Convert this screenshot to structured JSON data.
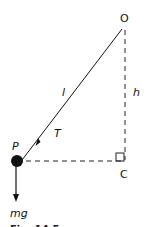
{
  "diagram": {
    "points": {
      "O": {
        "label": "O",
        "x": 125,
        "y": 17
      },
      "P": {
        "label": "P",
        "x": 21,
        "y": 161
      },
      "C": {
        "label": "C",
        "x": 125,
        "y": 161
      }
    },
    "labels": {
      "string_length": "l",
      "height": "h",
      "tension": "T",
      "weight": "mg"
    },
    "caption_partial": "Fig. 14.5",
    "colors": {
      "line": "#111111",
      "background": "#ffffff"
    }
  }
}
